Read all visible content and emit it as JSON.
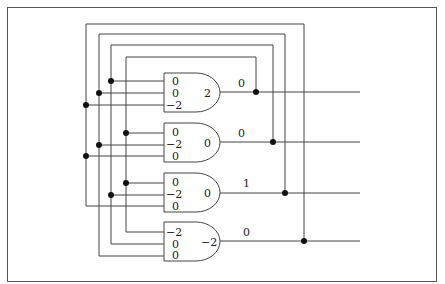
{
  "diagram": {
    "type": "network of summation gates with feedback loops",
    "gates": [
      {
        "id": "gate-1",
        "inputs": [
          "0",
          "0",
          "−2"
        ],
        "sum": "2",
        "output": "0"
      },
      {
        "id": "gate-2",
        "inputs": [
          "0",
          "−2",
          "0"
        ],
        "sum": "0",
        "output": "0"
      },
      {
        "id": "gate-3",
        "inputs": [
          "0",
          "−2",
          "0"
        ],
        "sum": "0",
        "output": "1"
      },
      {
        "id": "gate-4",
        "inputs": [
          "−2",
          "0",
          "0"
        ],
        "sum": "−2",
        "output": "0"
      }
    ]
  }
}
